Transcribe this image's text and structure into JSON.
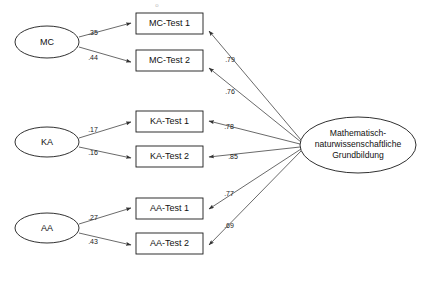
{
  "diagram": {
    "type": "path-diagram",
    "background_color": "#ffffff",
    "line_color": "#444444",
    "shape_stroke_color": "#1a1a1a",
    "artifact_mark": "o"
  },
  "predictors": [
    {
      "id": "mc",
      "label": "MC",
      "cx": 47,
      "cy": 42,
      "rx": 32,
      "ry": 16
    },
    {
      "id": "ka",
      "label": "KA",
      "cx": 47,
      "cy": 142,
      "rx": 32,
      "ry": 15
    },
    {
      "id": "aa",
      "label": "AA",
      "cx": 47,
      "cy": 228,
      "rx": 32,
      "ry": 15
    }
  ],
  "indicators": [
    {
      "id": "mc1",
      "label": "MC-Test 1",
      "x": 136,
      "y": 13,
      "w": 67,
      "h": 21
    },
    {
      "id": "mc2",
      "label": "MC-Test 2",
      "x": 136,
      "y": 50,
      "w": 67,
      "h": 21
    },
    {
      "id": "ka1",
      "label": "KA-Test 1",
      "x": 136,
      "y": 111,
      "w": 67,
      "h": 21
    },
    {
      "id": "ka2",
      "label": "KA-Test 2",
      "x": 136,
      "y": 146,
      "w": 67,
      "h": 21
    },
    {
      "id": "aa1",
      "label": "AA-Test 1",
      "x": 136,
      "y": 198,
      "w": 67,
      "h": 21
    },
    {
      "id": "aa2",
      "label": "AA-Test 2",
      "x": 136,
      "y": 233,
      "w": 67,
      "h": 21
    }
  ],
  "latent": {
    "id": "mng",
    "cx": 358,
    "cy": 145,
    "rx": 58,
    "ry": 28,
    "lines": [
      "Mathematisch-",
      "naturwissenschaftliche",
      "Grundbildung"
    ]
  },
  "predictor_paths": [
    {
      "from": "mc",
      "to": "mc1",
      "coefficient": ".35",
      "label_x": 93,
      "label_y": 33
    },
    {
      "from": "mc",
      "to": "mc2",
      "coefficient": ".44",
      "label_x": 93,
      "label_y": 58
    },
    {
      "from": "ka",
      "to": "ka1",
      "coefficient": ".17",
      "label_x": 93,
      "label_y": 130
    },
    {
      "from": "ka",
      "to": "ka2",
      "coefficient": ".16",
      "label_x": 93,
      "label_y": 153
    },
    {
      "from": "aa",
      "to": "aa1",
      "coefficient": ".27",
      "label_x": 93,
      "label_y": 218
    },
    {
      "from": "aa",
      "to": "aa2",
      "coefficient": ".43",
      "label_x": 93,
      "label_y": 242
    }
  ],
  "loading_paths": [
    {
      "from": "mng",
      "to": "mc1",
      "coefficient": ".79",
      "label_x": 230,
      "label_y": 60
    },
    {
      "from": "mng",
      "to": "mc2",
      "coefficient": ".76",
      "label_x": 230,
      "label_y": 92
    },
    {
      "from": "mng",
      "to": "ka1",
      "coefficient": ".78",
      "label_x": 229,
      "label_y": 127
    },
    {
      "from": "mng",
      "to": "ka2",
      "coefficient": ".85",
      "label_x": 233,
      "label_y": 157
    },
    {
      "from": "mng",
      "to": "aa1",
      "coefficient": ".77",
      "label_x": 229,
      "label_y": 194
    },
    {
      "from": "mng",
      "to": "aa2",
      "coefficient": ".69",
      "label_x": 229,
      "label_y": 226
    }
  ]
}
